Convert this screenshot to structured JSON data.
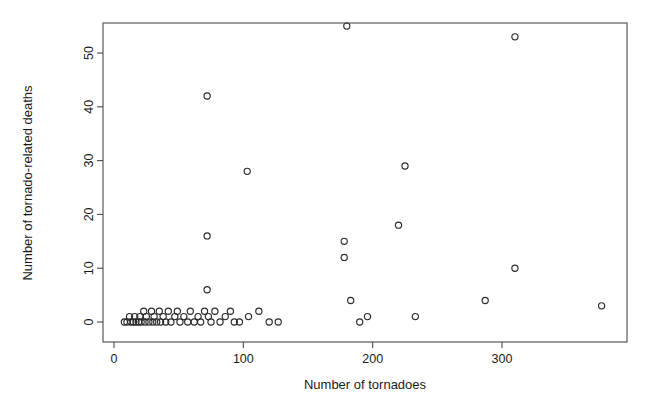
{
  "figure": {
    "background_color": "#ffffff",
    "marker_color": "#2b2b2b",
    "axis_color": "#4a4a4a",
    "marker_symbol": "open-circle"
  },
  "chart_data": {
    "type": "scatter",
    "title": "",
    "xlabel": "Number of tornadoes",
    "ylabel": "Number of tornado-related deaths",
    "xlim": [
      -8,
      397
    ],
    "ylim": [
      -3,
      59
    ],
    "xticks": [
      0,
      100,
      200,
      300
    ],
    "yticks": [
      0,
      10,
      20,
      30,
      40,
      50
    ],
    "xtick_labels": [
      "0",
      "100",
      "200",
      "300"
    ],
    "ytick_labels": [
      "0",
      "10",
      "20",
      "30",
      "40",
      "50"
    ],
    "grid": false,
    "legend": null,
    "marker": "o",
    "marker_filled": false,
    "n_points": 63,
    "points": [
      {
        "x": 8,
        "y": 0
      },
      {
        "x": 10,
        "y": 0
      },
      {
        "x": 12,
        "y": 1
      },
      {
        "x": 13,
        "y": 0
      },
      {
        "x": 15,
        "y": 0
      },
      {
        "x": 16,
        "y": 1
      },
      {
        "x": 17,
        "y": 0
      },
      {
        "x": 19,
        "y": 0
      },
      {
        "x": 20,
        "y": 1
      },
      {
        "x": 21,
        "y": 0
      },
      {
        "x": 23,
        "y": 2
      },
      {
        "x": 24,
        "y": 0
      },
      {
        "x": 25,
        "y": 1
      },
      {
        "x": 27,
        "y": 0
      },
      {
        "x": 29,
        "y": 2
      },
      {
        "x": 30,
        "y": 0
      },
      {
        "x": 31,
        "y": 1
      },
      {
        "x": 33,
        "y": 0
      },
      {
        "x": 35,
        "y": 2
      },
      {
        "x": 36,
        "y": 0
      },
      {
        "x": 38,
        "y": 1
      },
      {
        "x": 40,
        "y": 0
      },
      {
        "x": 42,
        "y": 2
      },
      {
        "x": 44,
        "y": 0
      },
      {
        "x": 47,
        "y": 1
      },
      {
        "x": 49,
        "y": 2
      },
      {
        "x": 51,
        "y": 0
      },
      {
        "x": 54,
        "y": 1
      },
      {
        "x": 57,
        "y": 0
      },
      {
        "x": 59,
        "y": 2
      },
      {
        "x": 62,
        "y": 0
      },
      {
        "x": 65,
        "y": 1
      },
      {
        "x": 67,
        "y": 0
      },
      {
        "x": 70,
        "y": 2
      },
      {
        "x": 72,
        "y": 42
      },
      {
        "x": 72,
        "y": 16
      },
      {
        "x": 72,
        "y": 6
      },
      {
        "x": 73,
        "y": 1
      },
      {
        "x": 75,
        "y": 0
      },
      {
        "x": 78,
        "y": 2
      },
      {
        "x": 82,
        "y": 0
      },
      {
        "x": 86,
        "y": 1
      },
      {
        "x": 90,
        "y": 2
      },
      {
        "x": 93,
        "y": 0
      },
      {
        "x": 97,
        "y": 0
      },
      {
        "x": 103,
        "y": 28
      },
      {
        "x": 104,
        "y": 1
      },
      {
        "x": 112,
        "y": 2
      },
      {
        "x": 120,
        "y": 0
      },
      {
        "x": 127,
        "y": 0
      },
      {
        "x": 178,
        "y": 15
      },
      {
        "x": 178,
        "y": 12
      },
      {
        "x": 180,
        "y": 55
      },
      {
        "x": 183,
        "y": 4
      },
      {
        "x": 190,
        "y": 0
      },
      {
        "x": 196,
        "y": 1
      },
      {
        "x": 220,
        "y": 18
      },
      {
        "x": 225,
        "y": 29
      },
      {
        "x": 233,
        "y": 1
      },
      {
        "x": 287,
        "y": 4
      },
      {
        "x": 310,
        "y": 53
      },
      {
        "x": 310,
        "y": 10
      },
      {
        "x": 377,
        "y": 3
      }
    ]
  }
}
